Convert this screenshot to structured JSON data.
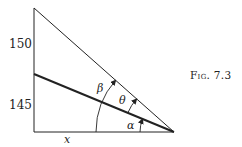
{
  "figure": {
    "caption": "Fig. 7.3",
    "axis_labels": {
      "upper": "150",
      "lower": "145",
      "base": "x"
    },
    "angle_labels": {
      "beta": "β",
      "theta": "θ",
      "alpha": "α"
    },
    "geometry": {
      "apex": [
        174,
        132
      ],
      "vertical_top": [
        34,
        8
      ],
      "vertical_bottom": [
        34,
        132
      ],
      "mid_line_start": [
        34,
        74
      ]
    },
    "colors": {
      "line": "#222222",
      "background": "#ffffff"
    }
  }
}
